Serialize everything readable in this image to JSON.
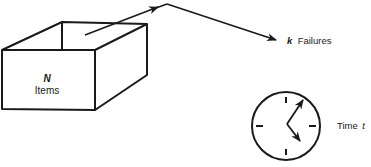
{
  "box": {
    "symbol": "N",
    "label": "Items"
  },
  "output": {
    "symbol": "k",
    "label": "Failures"
  },
  "clock": {
    "label": "Time",
    "symbol": "t"
  },
  "colors": {
    "stroke": "#1a1a1a",
    "background": "#ffffff"
  }
}
